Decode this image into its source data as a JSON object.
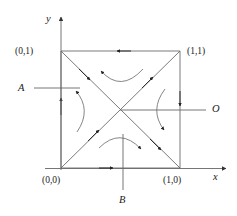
{
  "figure": {
    "type": "diagram",
    "stroke_color": "#555555",
    "text_color": "#1a1a1a",
    "background": "#ffffff",
    "top_artifact_text": "",
    "axes": {
      "x_label": "x",
      "y_label": "y",
      "origin_coord": "(0,0)"
    },
    "corner_labels": {
      "bottom_left": "(0,0)",
      "top_left": "(0,1)",
      "top_right": "(1,1)",
      "bottom_right": "(1,0)"
    },
    "callouts": [
      {
        "id": "A",
        "label": "A",
        "side": "left"
      },
      {
        "id": "O",
        "label": "O",
        "side": "right"
      },
      {
        "id": "B",
        "label": "B",
        "side": "bottom"
      }
    ],
    "square": {
      "x0": 0,
      "y0": 0,
      "x1": 1,
      "y1": 1,
      "edge_arrow_directions": {
        "top": "left",
        "bottom": "right",
        "left": "up",
        "right": "down"
      }
    },
    "diagonals": [
      {
        "from": "(0,0)",
        "to": "(1,1)",
        "arrow_direction": "up-right"
      },
      {
        "from": "(0,1)",
        "to": "(1,0)",
        "arrow_direction": "down-right"
      }
    ],
    "flow_arcs": [
      {
        "quadrant": "top",
        "curve": "concave-up",
        "arrow_at": "left-end"
      },
      {
        "quadrant": "left",
        "curve": "bulge-right",
        "arrow_at": "top-end"
      },
      {
        "quadrant": "right",
        "curve": "bulge-left",
        "arrow_at": "bottom-end"
      },
      {
        "quadrant": "bottom",
        "curve": "concave-down",
        "arrow_at": "right-end"
      }
    ]
  }
}
